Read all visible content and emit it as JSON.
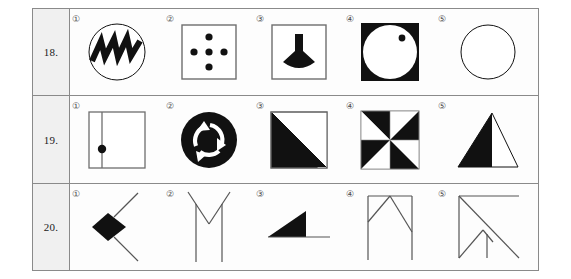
{
  "page": {
    "background_color": "#ffffff",
    "border_color": "#8a8a8a",
    "ink_color": "#111111",
    "row_label_bg": "#f0f0f0"
  },
  "rows": [
    {
      "number": "18.",
      "options": [
        {
          "marker": "①",
          "figure": "circle-with-zigzag",
          "description": "circle outline containing a thick black zigzag"
        },
        {
          "marker": "②",
          "figure": "square-with-five-dots",
          "description": "square outline with five black dots in a plus arrangement"
        },
        {
          "marker": "③",
          "figure": "square-with-black-vase",
          "description": "square outline containing a solid black vase / funnel shape"
        },
        {
          "marker": "④",
          "figure": "black-square-white-circle-dot",
          "description": "solid black square with inscribed white circle and small black dot upper right"
        },
        {
          "marker": "⑤",
          "figure": "empty-circle",
          "description": "plain circle outline"
        }
      ]
    },
    {
      "number": "19.",
      "options": [
        {
          "marker": "①",
          "figure": "square-with-line-and-dot",
          "description": "square outline with vertical line near left edge and black dot on the line"
        },
        {
          "marker": "②",
          "figure": "black-disc-recycle-arrows",
          "description": "solid black disc with three white circular arrows"
        },
        {
          "marker": "③",
          "figure": "square-half-black-diagonal",
          "description": "square outline with left triangle filled black along the diagonal"
        },
        {
          "marker": "④",
          "figure": "pinwheel-eight-triangles",
          "description": "square divided into eight alternating black and white triangles"
        },
        {
          "marker": "⑤",
          "figure": "triangle-left-half-black",
          "description": "triangle outline with its left half filled black"
        }
      ]
    },
    {
      "number": "20.",
      "options": [
        {
          "marker": "①",
          "figure": "black-diamond-with-two-lines",
          "description": "solid black diamond with two diagonal lines forming an arrow"
        },
        {
          "marker": "②",
          "figure": "v-with-two-vertical-lines",
          "description": "V shape at top with two long vertical lines hanging down"
        },
        {
          "marker": "③",
          "figure": "black-right-triangle-with-line",
          "description": "solid black right triangle with horizontal line extending right"
        },
        {
          "marker": "④",
          "figure": "two-posts-with-peak",
          "description": "two vertical posts, top horizontal bar and inverted V peak"
        },
        {
          "marker": "⑤",
          "figure": "square-with-diagonals-and-post",
          "description": "open square outline with long diagonal, inner V and short vertical post"
        }
      ]
    }
  ]
}
